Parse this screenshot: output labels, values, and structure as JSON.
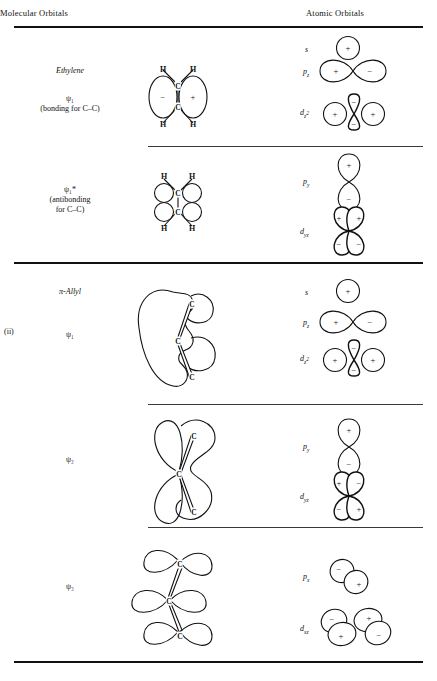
{
  "figure": {
    "headers": {
      "molecular_orbitals": "Molecular Orbitals",
      "atomic_orbitals": "Atomic Orbitals"
    },
    "section_marker": "(ii)"
  },
  "rows": [
    {
      "id": "ethylene-psi1",
      "mo_title": "Ethylene",
      "mo_label_line1": "ψ₁",
      "mo_label_line2": "(bonding for C–C)",
      "mo_atoms": [
        "H",
        "H",
        "C",
        "C",
        "H",
        "H"
      ],
      "mo_signs": [
        "−",
        "+"
      ],
      "ao_list": [
        {
          "name": "s",
          "sub": "",
          "sup": "",
          "signs": [
            "+"
          ]
        },
        {
          "name": "p",
          "sub": "z",
          "sup": "",
          "signs": [
            "+",
            "−"
          ]
        },
        {
          "name": "d",
          "sub": "z",
          "sup": "2",
          "signs": [
            "+",
            "−",
            "+",
            "−"
          ]
        }
      ]
    },
    {
      "id": "ethylene-psi1-star",
      "mo_title": "",
      "mo_label_line1": "ψ₁*",
      "mo_label_line2": "(antibonding",
      "mo_label_line3": "for C–C)",
      "mo_atoms": [
        "H",
        "H",
        "C",
        "C",
        "H",
        "H"
      ],
      "ao_list": [
        {
          "name": "p",
          "sub": "y",
          "sup": "",
          "signs": [
            "+",
            "−"
          ]
        },
        {
          "name": "d",
          "sub": "yz",
          "sup": "",
          "signs": [
            "+",
            "+",
            "−",
            "−"
          ]
        }
      ]
    },
    {
      "id": "allyl-psi1",
      "mo_title": "π-Allyl",
      "mo_label_line1": "ψ₁",
      "mo_atoms": [
        "C",
        "C",
        "C"
      ],
      "ao_list": [
        {
          "name": "s",
          "sub": "",
          "sup": "",
          "signs": [
            "+"
          ]
        },
        {
          "name": "p",
          "sub": "z",
          "sup": "",
          "signs": [
            "+",
            "−"
          ]
        },
        {
          "name": "d",
          "sub": "z",
          "sup": "2",
          "signs": [
            "+",
            "−",
            "+",
            "−"
          ]
        }
      ]
    },
    {
      "id": "allyl-psi2",
      "mo_title": "",
      "mo_label_line1": "ψ₂",
      "mo_atoms": [
        "C",
        "C",
        "C"
      ],
      "ao_list": [
        {
          "name": "p",
          "sub": "y",
          "sup": "",
          "signs": [
            "+",
            "−"
          ]
        },
        {
          "name": "d",
          "sub": "yz",
          "sup": "",
          "signs": [
            "+",
            "−",
            "−",
            "+"
          ]
        }
      ]
    },
    {
      "id": "allyl-psi3",
      "mo_title": "",
      "mo_label_line1": "ψ₃",
      "mo_atoms": [
        "C",
        "C",
        "C"
      ],
      "ao_list": [
        {
          "name": "p",
          "sub": "x",
          "sup": "",
          "signs": [
            "−",
            "+"
          ]
        },
        {
          "name": "d",
          "sub": "xz",
          "sup": "",
          "signs": [
            "−",
            "+",
            "+",
            "−"
          ]
        }
      ]
    }
  ]
}
